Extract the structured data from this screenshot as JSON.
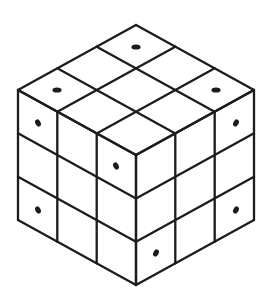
{
  "diagram": {
    "grid_size": 3,
    "colors": {
      "line": "#1c1c1c",
      "background": "#ffffff",
      "dot": "#1c1c1c"
    },
    "geometry": {
      "top_vertex": [
        136,
        25
      ],
      "left_step": [
        -39.33,
        21.67
      ],
      "right_step": [
        39.33,
        21.67
      ],
      "vertical_step": 43.33
    },
    "faces": {
      "top": {
        "dots": [
          [
            136,
            47
          ],
          [
            57,
            90
          ],
          [
            216,
            90
          ]
        ]
      },
      "left": {
        "dots": [
          [
            38,
            123
          ],
          [
            38,
            210
          ],
          [
            116,
            166
          ]
        ]
      },
      "right": {
        "dots": [
          [
            236,
            123
          ],
          [
            236,
            210
          ],
          [
            156,
            253
          ]
        ]
      }
    }
  }
}
